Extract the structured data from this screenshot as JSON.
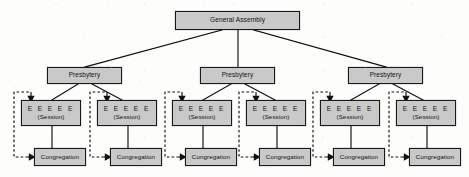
{
  "diagram": {
    "type": "organizational-hierarchy",
    "colors": {
      "box_fill": "#c9c9c9",
      "box_border": "#1a1a1a",
      "connector": "#111111",
      "dashed_loop": "#111111",
      "background": "#fdfdfb"
    },
    "assembly": {
      "label": "General Assembly"
    },
    "presbyteries": [
      {
        "label": "Presbytery"
      },
      {
        "label": "Presbytery"
      },
      {
        "label": "Presbytery"
      }
    ],
    "sessions": [
      {
        "elders": "E E E E E",
        "label": "(Session)"
      },
      {
        "elders": "E E E E E",
        "label": "(Session)"
      },
      {
        "elders": "E E E E E",
        "label": "(Session)"
      },
      {
        "elders": "E E E E E",
        "label": "(Session)"
      },
      {
        "elders": "E E E E E",
        "label": "(Session)"
      },
      {
        "elders": "E E E E E",
        "label": "(Session)"
      }
    ],
    "congregations": [
      {
        "label": "Congregation"
      },
      {
        "label": "Congregation"
      },
      {
        "label": "Congregation"
      },
      {
        "label": "Congregation"
      },
      {
        "label": "Congregation"
      },
      {
        "label": "Congregation"
      }
    ]
  }
}
